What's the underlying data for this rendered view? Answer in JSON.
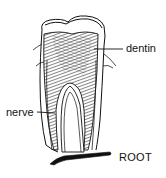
{
  "diagram": {
    "labels": [
      {
        "id": "dentin",
        "text": "dentin"
      },
      {
        "id": "nerve",
        "text": "nerve"
      },
      {
        "id": "root",
        "text": "ROOT"
      }
    ],
    "colors": {
      "ink": "#111111",
      "background": "#ffffff"
    }
  }
}
